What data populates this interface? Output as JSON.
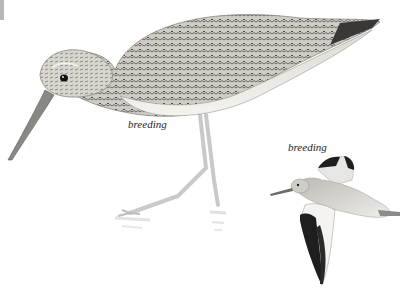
{
  "image": {
    "subject": "Willet illustrations (standing and in flight)",
    "background_color": "#ffffff",
    "corner_tab_color": "#b8b8b8"
  },
  "captions": {
    "standing_bird": "breeding",
    "flying_bird": "breeding"
  },
  "palette": {
    "plumage_light": "#d9d6d0",
    "plumage_mid": "#9e9a94",
    "plumage_dark": "#4a4846",
    "wing_black": "#1e1e1e",
    "belly_white": "#f2f1ee",
    "leg_gray": "#c9c9c9",
    "eye": "#111111"
  }
}
